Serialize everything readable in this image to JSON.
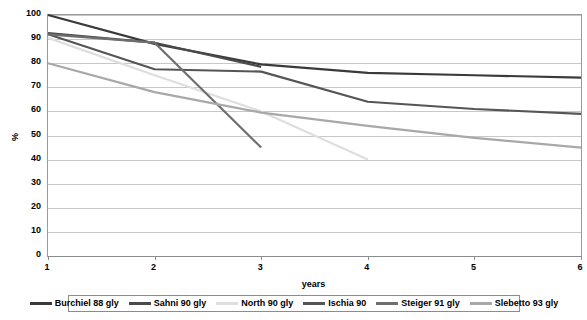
{
  "chart_data": {
    "type": "line",
    "title": "",
    "xlabel": "years",
    "ylabel": "%",
    "x": [
      1,
      2,
      3,
      4,
      5,
      6
    ],
    "xlim": [
      1,
      6
    ],
    "ylim": [
      0,
      100
    ],
    "ytick_labels": [
      "100",
      "90",
      "80",
      "70",
      "60",
      "50",
      "40",
      "30",
      "20",
      "10",
      "0"
    ],
    "yticks": [
      100,
      90,
      80,
      70,
      60,
      50,
      40,
      30,
      20,
      10,
      0
    ],
    "xtick_labels": [
      "1",
      "2",
      "3",
      "4",
      "5",
      "6"
    ],
    "grid": true,
    "legend_position": "bottom",
    "series": [
      {
        "name": "Burchiel 88 gly",
        "color": "#3a3a3a",
        "x": [
          1,
          2,
          3,
          4,
          5,
          6
        ],
        "values": [
          100,
          88,
          79.5,
          76,
          75,
          74
        ]
      },
      {
        "name": "Sahni 90 gly",
        "color": "#4a4a4a",
        "x": [
          1,
          2,
          3
        ],
        "values": [
          92.5,
          88.5,
          78.5
        ]
      },
      {
        "name": "North 90 gly",
        "color": "#dedede",
        "x": [
          1,
          2,
          3,
          4
        ],
        "values": [
          90.5,
          75,
          60,
          40
        ]
      },
      {
        "name": "Ischia 90",
        "color": "#555555",
        "x": [
          1,
          2,
          3,
          4,
          5,
          6
        ],
        "values": [
          92,
          77.5,
          76.5,
          64,
          61,
          59
        ]
      },
      {
        "name": "Steiger 91 gly",
        "color": "#6e6e6e",
        "x": [
          1,
          2,
          3
        ],
        "values": [
          92,
          88.5,
          45
        ]
      },
      {
        "name": "Slebetto 93 gly",
        "color": "#a8a8a8",
        "x": [
          1,
          2,
          3,
          4,
          5,
          6
        ],
        "values": [
          80,
          68,
          59.5,
          54,
          49,
          45
        ]
      }
    ]
  }
}
